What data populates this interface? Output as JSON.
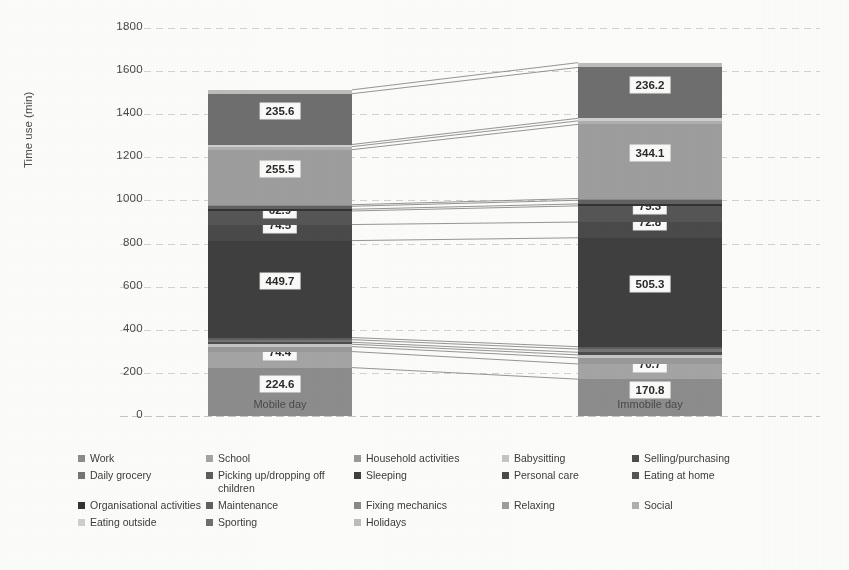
{
  "chart_data": {
    "type": "bar",
    "title": "",
    "subtitle": "",
    "xlabel": "",
    "ylabel": "Time use (min)",
    "ylim": [
      0,
      1800
    ],
    "yticks": [
      0,
      200,
      400,
      600,
      800,
      1000,
      1200,
      1400,
      1600,
      1800
    ],
    "grid": true,
    "legend_position": "bottom",
    "stacked": true,
    "categories": [
      "Mobile day",
      "Immobile day"
    ],
    "series": [
      {
        "name": "Work",
        "color": "#8d8d8d",
        "values": [
          224.6,
          170.8
        ],
        "labels": [
          "224.6",
          "170.8"
        ]
      },
      {
        "name": "School",
        "color": "#a5a5a5",
        "values": [
          74.4,
          70.7
        ],
        "labels": [
          "74.4",
          "70.7"
        ]
      },
      {
        "name": "Household activities",
        "color": "#9a9a9a",
        "values": [
          23.0,
          28.0
        ],
        "labels": [
          "",
          ""
        ]
      },
      {
        "name": "Babysitting",
        "color": "#c6c6c6",
        "values": [
          11.0,
          14.0
        ],
        "labels": [
          "",
          ""
        ]
      },
      {
        "name": "Selling/purchasing",
        "color": "#4e4e4e",
        "values": [
          9.0,
          12.0
        ],
        "labels": [
          "",
          ""
        ]
      },
      {
        "name": "Daily grocery",
        "color": "#767676",
        "values": [
          12.0,
          15.0
        ],
        "labels": [
          "",
          ""
        ]
      },
      {
        "name": "Picking up/dropping off children",
        "color": "#5e5e5e",
        "values": [
          10.0,
          11.0
        ],
        "labels": [
          "",
          ""
        ]
      },
      {
        "name": "Sleeping",
        "color": "#3f3f3f",
        "values": [
          449.7,
          505.3
        ],
        "labels": [
          "449.7",
          "505.3"
        ]
      },
      {
        "name": "Personal care",
        "color": "#4a4a4a",
        "values": [
          74.5,
          72.8
        ],
        "labels": [
          "74.5",
          "72.8"
        ]
      },
      {
        "name": "Eating at home",
        "color": "#565656",
        "values": [
          62.9,
          75.3
        ],
        "labels": [
          "62.9",
          "75.3"
        ]
      },
      {
        "name": "Organisational activities",
        "color": "#333333",
        "values": [
          8.0,
          9.0
        ],
        "labels": [
          "",
          ""
        ]
      },
      {
        "name": "Maintenance",
        "color": "#616161",
        "values": [
          14.0,
          17.0
        ],
        "labels": [
          "",
          ""
        ]
      },
      {
        "name": "Fixing mechanics",
        "color": "#8a8a8a",
        "values": [
          7.0,
          8.0
        ],
        "labels": [
          "",
          ""
        ]
      },
      {
        "name": "Relaxing",
        "color": "#9e9e9e",
        "values": [
          255.5,
          344.1
        ],
        "labels": [
          "255.5",
          "344.1"
        ]
      },
      {
        "name": "Social",
        "color": "#b0b0b0",
        "values": [
          14.0,
          16.0
        ],
        "labels": [
          "",
          ""
        ]
      },
      {
        "name": "Eating outside",
        "color": "#d0d0d0",
        "values": [
          10.0,
          12.0
        ],
        "labels": [
          "",
          ""
        ]
      },
      {
        "name": "Sporting",
        "color": "#6f6f6f",
        "values": [
          235.6,
          236.2
        ],
        "labels": [
          "235.6",
          "236.2"
        ]
      },
      {
        "name": "Holidays",
        "color": "#bdbdbd",
        "values": [
          18.0,
          22.0
        ],
        "labels": [
          "",
          ""
        ]
      }
    ],
    "totals": [
      1515.2,
      1640.2
    ],
    "connector_lines": true
  },
  "axis": {
    "y_title": "Time use (min)",
    "y_ticks": [
      "1800",
      "1600",
      "1400",
      "1200",
      "1000",
      "800",
      "600",
      "400",
      "200",
      "0"
    ],
    "x_categories": [
      "Mobile day",
      "Immobile day"
    ]
  },
  "legend": {
    "rows": [
      [
        {
          "label": "Work",
          "color": "#8d8d8d"
        },
        {
          "label": "School",
          "color": "#a5a5a5"
        },
        {
          "label": "Household activities",
          "color": "#9a9a9a"
        },
        {
          "label": "Babysitting",
          "color": "#c6c6c6"
        },
        {
          "label": "Selling/purchasing",
          "color": "#4e4e4e"
        }
      ],
      [
        {
          "label": "Daily grocery",
          "color": "#767676"
        },
        {
          "label": "Picking up/dropping off children",
          "color": "#5e5e5e"
        },
        {
          "label": "Sleeping",
          "color": "#3f3f3f"
        },
        {
          "label": "Personal care",
          "color": "#4a4a4a"
        },
        {
          "label": "Eating at home",
          "color": "#565656"
        }
      ],
      [
        {
          "label": "Organisational activities",
          "color": "#333333"
        },
        {
          "label": "Maintenance",
          "color": "#616161"
        },
        {
          "label": "Fixing mechanics",
          "color": "#8a8a8a"
        },
        {
          "label": "Relaxing",
          "color": "#9e9e9e"
        },
        {
          "label": "Social",
          "color": "#b0b0b0"
        }
      ],
      [
        {
          "label": "Eating outside",
          "color": "#d0d0d0"
        },
        {
          "label": "Sporting",
          "color": "#6f6f6f"
        },
        {
          "label": "Holidays",
          "color": "#bdbdbd"
        }
      ]
    ]
  }
}
